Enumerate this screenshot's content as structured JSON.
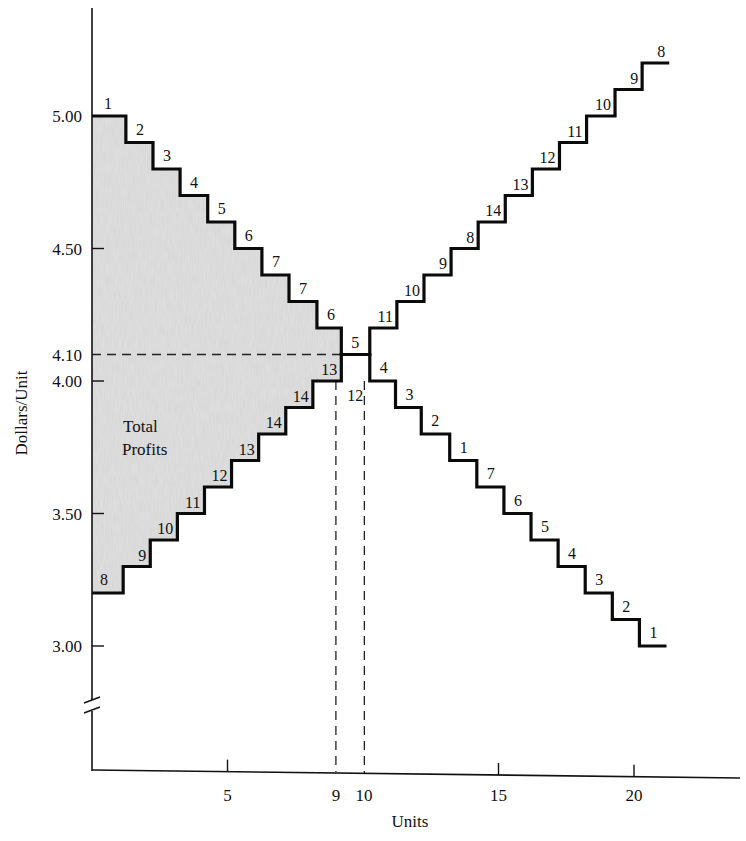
{
  "chart_data": {
    "type": "line",
    "subtype": "step",
    "title": "",
    "xlabel": "Units",
    "ylabel": "Dollars/Unit",
    "xlim": [
      0,
      24
    ],
    "ylim": [
      2.5,
      5.35
    ],
    "y_axis_break": true,
    "grid": false,
    "legend": "none",
    "x_ticks": [
      {
        "value": 5,
        "label": "5"
      },
      {
        "value": 9,
        "label": "9"
      },
      {
        "value": 10,
        "label": "10"
      },
      {
        "value": 15,
        "label": "15"
      },
      {
        "value": 20,
        "label": "20"
      }
    ],
    "y_ticks": [
      {
        "value": 5.0,
        "label": "5.00"
      },
      {
        "value": 4.5,
        "label": "4.50"
      },
      {
        "value": 4.1,
        "label": "4.10"
      },
      {
        "value": 4.0,
        "label": "4.00"
      },
      {
        "value": 3.5,
        "label": "3.50"
      },
      {
        "value": 3.0,
        "label": "3.00"
      }
    ],
    "annotations": [
      {
        "text": "Total Profits",
        "lines": [
          "Total",
          "Profits"
        ],
        "region": "shaded area between demand and supply steps, units 0-9"
      },
      {
        "text": "dashed horizontal at 4.10 from y-axis to unit 9"
      },
      {
        "text": "dashed vertical at unit 9 and unit 10"
      }
    ],
    "series": [
      {
        "name": "Demand (bids, descending)",
        "steps": [
          {
            "x_start": 0,
            "x_end": 1.25,
            "y": 5.0,
            "label": "1"
          },
          {
            "x_start": 1.25,
            "x_end": 2.25,
            "y": 4.9,
            "label": "2"
          },
          {
            "x_start": 2.25,
            "x_end": 3.25,
            "y": 4.8,
            "label": "3"
          },
          {
            "x_start": 3.25,
            "x_end": 4.27,
            "y": 4.7,
            "label": "4"
          },
          {
            "x_start": 4.27,
            "x_end": 5.27,
            "y": 4.6,
            "label": "5"
          },
          {
            "x_start": 5.27,
            "x_end": 6.27,
            "y": 4.5,
            "label": "6"
          },
          {
            "x_start": 6.27,
            "x_end": 7.27,
            "y": 4.4,
            "label": "7"
          },
          {
            "x_start": 7.27,
            "x_end": 8.3,
            "y": 4.3,
            "label": "7"
          },
          {
            "x_start": 8.3,
            "x_end": 9.2,
            "y": 4.2,
            "label": "6"
          },
          {
            "x_start": 9.2,
            "x_end": 10.25,
            "y": 4.1,
            "label": "5"
          },
          {
            "x_start": 10.25,
            "x_end": 11.2,
            "y": 4.0,
            "label": "4"
          },
          {
            "x_start": 11.2,
            "x_end": 12.15,
            "y": 3.9,
            "label": "3"
          },
          {
            "x_start": 12.15,
            "x_end": 13.2,
            "y": 3.8,
            "label": "2"
          },
          {
            "x_start": 13.2,
            "x_end": 14.2,
            "y": 3.7,
            "label": "1"
          },
          {
            "x_start": 14.2,
            "x_end": 15.2,
            "y": 3.6,
            "label": "7"
          },
          {
            "x_start": 15.2,
            "x_end": 16.2,
            "y": 3.5,
            "label": "6"
          },
          {
            "x_start": 16.2,
            "x_end": 17.2,
            "y": 3.4,
            "label": "5"
          },
          {
            "x_start": 17.2,
            "x_end": 18.2,
            "y": 3.3,
            "label": "4"
          },
          {
            "x_start": 18.2,
            "x_end": 19.2,
            "y": 3.2,
            "label": "3"
          },
          {
            "x_start": 19.2,
            "x_end": 20.2,
            "y": 3.1,
            "label": "2"
          },
          {
            "x_start": 20.2,
            "x_end": 21.2,
            "y": 3.0,
            "label": "1"
          }
        ]
      },
      {
        "name": "Supply (offers, ascending)",
        "steps": [
          {
            "x_start": 0,
            "x_end": 1.15,
            "y": 3.2,
            "label": "8"
          },
          {
            "x_start": 1.15,
            "x_end": 2.15,
            "y": 3.3,
            "label": "9"
          },
          {
            "x_start": 2.15,
            "x_end": 3.15,
            "y": 3.4,
            "label": "10"
          },
          {
            "x_start": 3.15,
            "x_end": 4.15,
            "y": 3.5,
            "label": "11"
          },
          {
            "x_start": 4.15,
            "x_end": 5.15,
            "y": 3.6,
            "label": "12"
          },
          {
            "x_start": 5.15,
            "x_end": 6.15,
            "y": 3.7,
            "label": "13"
          },
          {
            "x_start": 6.15,
            "x_end": 7.15,
            "y": 3.8,
            "label": "14"
          },
          {
            "x_start": 7.15,
            "x_end": 8.15,
            "y": 3.9,
            "label": "14"
          },
          {
            "x_start": 8.15,
            "x_end": 9.2,
            "y": 4.0,
            "label": "13"
          },
          {
            "x_start": 9.2,
            "x_end": 10.25,
            "y": 4.1,
            "label": "12"
          },
          {
            "x_start": 10.25,
            "x_end": 11.25,
            "y": 4.2,
            "label": "11"
          },
          {
            "x_start": 11.25,
            "x_end": 12.25,
            "y": 4.3,
            "label": "10"
          },
          {
            "x_start": 12.25,
            "x_end": 13.25,
            "y": 4.4,
            "label": "9"
          },
          {
            "x_start": 13.25,
            "x_end": 14.25,
            "y": 4.5,
            "label": "8"
          },
          {
            "x_start": 14.25,
            "x_end": 15.25,
            "y": 4.6,
            "label": "14"
          },
          {
            "x_start": 15.25,
            "x_end": 16.25,
            "y": 4.7,
            "label": "13"
          },
          {
            "x_start": 16.25,
            "x_end": 17.25,
            "y": 4.8,
            "label": "12"
          },
          {
            "x_start": 17.25,
            "x_end": 18.25,
            "y": 4.9,
            "label": "11"
          },
          {
            "x_start": 18.25,
            "x_end": 19.3,
            "y": 5.0,
            "label": "10"
          },
          {
            "x_start": 19.3,
            "x_end": 20.3,
            "y": 5.1,
            "label": "9"
          },
          {
            "x_start": 20.3,
            "x_end": 21.3,
            "y": 5.2,
            "label": "8"
          }
        ]
      }
    ],
    "equilibrium": {
      "price": 4.1,
      "quantity_range": [
        9,
        10
      ]
    }
  },
  "labels": {
    "xlabel": "Units",
    "ylabel": "Dollars/Unit",
    "profit_line1": "Total",
    "profit_line2": "Profits"
  }
}
